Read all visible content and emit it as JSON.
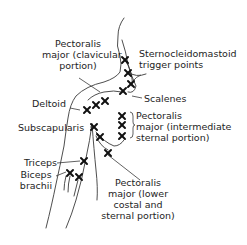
{
  "diagram": {
    "marker_glyph": "X",
    "colors": {
      "line": "#3a3a3a",
      "marker": "#111111",
      "text": "#1e1e1e",
      "background": "#ffffff"
    },
    "labels": {
      "pectoralis_clavicular": [
        "Pectoralis",
        "major (clavicular",
        "portion)"
      ],
      "sternocleidomastoid": [
        "Sternocleidomastoid",
        "trigger points"
      ],
      "scalenes": [
        "Scalenes"
      ],
      "deltoid": [
        "Deltoid"
      ],
      "pectoralis_intermediate": [
        "Pectoralis",
        "major (intermediate",
        "sternal portion)"
      ],
      "subscapularis": [
        "Subscapularis"
      ],
      "triceps": [
        "Triceps"
      ],
      "biceps": [
        "Biceps",
        "brachii"
      ],
      "pectoralis_lower": [
        "Pectoralis",
        "major (lower",
        "costal and",
        "sternal portion)"
      ]
    },
    "markers": [
      {
        "group": "sternocleidomastoid",
        "x": 125,
        "y": 60
      },
      {
        "group": "sternocleidomastoid",
        "x": 128,
        "y": 73
      },
      {
        "group": "sternocleidomastoid",
        "x": 131,
        "y": 84
      },
      {
        "group": "scalenes",
        "x": 123,
        "y": 91
      },
      {
        "group": "pectoralis_clavicular",
        "x": 105,
        "y": 101
      },
      {
        "group": "pectoralis_clavicular",
        "x": 96,
        "y": 105
      },
      {
        "group": "deltoid",
        "x": 87,
        "y": 110
      },
      {
        "group": "pectoralis_intermediate",
        "x": 122,
        "y": 116
      },
      {
        "group": "pectoralis_intermediate",
        "x": 122,
        "y": 125
      },
      {
        "group": "pectoralis_intermediate",
        "x": 122,
        "y": 136
      },
      {
        "group": "subscapularis",
        "x": 94,
        "y": 127
      },
      {
        "group": "subscapularis",
        "x": 100,
        "y": 137
      },
      {
        "group": "pectoralis_lower",
        "x": 108,
        "y": 153
      },
      {
        "group": "triceps",
        "x": 84,
        "y": 161
      },
      {
        "group": "biceps",
        "x": 70,
        "y": 173
      },
      {
        "group": "biceps",
        "x": 79,
        "y": 177
      }
    ]
  }
}
